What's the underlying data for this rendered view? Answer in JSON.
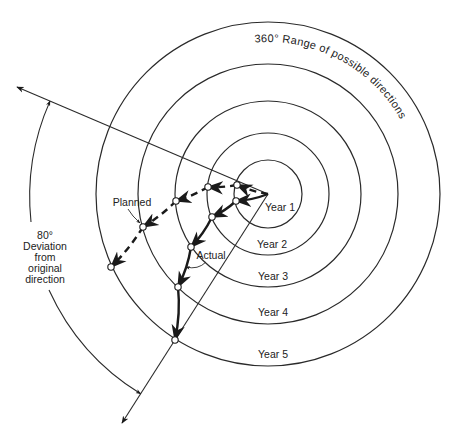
{
  "title_arc_label": "360° Range of possible directions",
  "rings": [
    {
      "label": "Year 1"
    },
    {
      "label": "Year 2"
    },
    {
      "label": "Year 3"
    },
    {
      "label": "Year 4"
    },
    {
      "label": "Year 5"
    }
  ],
  "deviation": {
    "degrees": 80,
    "label_lines": [
      "80°",
      "Deviation",
      "from",
      "original",
      "direction"
    ]
  },
  "paths": {
    "planned": {
      "label": "Planned",
      "style": "dashed"
    },
    "actual": {
      "label": "Actual",
      "style": "solid"
    }
  },
  "colors": {
    "line": "#2a2a2a",
    "background": "#ffffff"
  }
}
